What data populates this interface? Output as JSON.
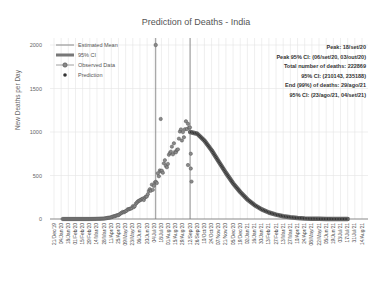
{
  "chart_data": {
    "type": "line",
    "title": "Prediction of Deaths - India",
    "xlabel": "",
    "ylabel": "New Deaths per Day",
    "ylim": [
      0,
      2000
    ],
    "yticks": [
      0,
      500,
      1000,
      1500,
      2000
    ],
    "grid": true,
    "legend_position": "upper left",
    "legend": [
      "Estimated Mean",
      "95% CI",
      "Observed Data",
      "Prediction"
    ],
    "annotations": [
      "Peak: 18/set/20",
      "Peak 95% CI: (06/set/20, 03/out/20)",
      "Total number of deaths: 222869",
      "95% CI: (210143, 235188)",
      "End (99%) of deaths: 29/ago/21",
      "95% CI: (23/ago/21, 04/set/21)"
    ],
    "x_tick_labels": [
      "21/Dec/19",
      "04/Jan/20",
      "18/Jan/20",
      "01/Feb/20",
      "15/Feb/20",
      "29/Feb/20",
      "14/Mar/20",
      "28/Mar/20",
      "11/Apr/20",
      "25/Apr/20",
      "09/May/20",
      "23/May/20",
      "06/Jun/20",
      "20/Jun/20",
      "04/Jul/20",
      "18/Jul/20",
      "01/Aug/20",
      "15/Aug/20",
      "29/Aug/20",
      "12/Sep/20",
      "26/Sep/20",
      "10/Oct/20",
      "24/Oct/20",
      "07/Nov/20",
      "21/Nov/20",
      "05/Dec/20",
      "19/Dec/20",
      "02/Jan/21",
      "16/Jan/21",
      "30/Jan/21",
      "13/Feb/21",
      "27/Feb/21",
      "13/Mar/21",
      "27/Mar/21",
      "10/Apr/21",
      "24/Apr/21",
      "08/May/21",
      "22/May/21",
      "05/Jun/21",
      "19/Jun/21",
      "03/Jul/21",
      "17/Jul/21",
      "31/Jul/21",
      "14/Aug/21"
    ],
    "series": [
      {
        "name": "Observed Data",
        "x_index": [
          3,
          4,
          5,
          6,
          7,
          8,
          9,
          10,
          11,
          12,
          13,
          14,
          15,
          16,
          17,
          18,
          18.5,
          19
        ],
        "values": [
          0,
          0,
          0,
          2,
          5,
          20,
          50,
          90,
          140,
          200,
          280,
          400,
          550,
          700,
          850,
          1000,
          1150,
          1100
        ],
        "outlier": {
          "x_index": 14.2,
          "value": 2000
        }
      },
      {
        "name": "Estimated Mean",
        "x_index": [
          19,
          20,
          21,
          22,
          23,
          24,
          25,
          26,
          27,
          28,
          29,
          30,
          31,
          32,
          33,
          34,
          35,
          36,
          37,
          38,
          39,
          40,
          41
        ],
        "values": [
          1000,
          980,
          900,
          790,
          660,
          530,
          410,
          310,
          225,
          160,
          110,
          75,
          50,
          32,
          20,
          12,
          7,
          4,
          2,
          1,
          0,
          0,
          0
        ]
      },
      {
        "name": "Prediction",
        "x_index": [
          19,
          20,
          21,
          22,
          23,
          24,
          25,
          26,
          27,
          28,
          29,
          30,
          31,
          32,
          33,
          34,
          35,
          36,
          37,
          38,
          39,
          40,
          41
        ],
        "values": [
          1000,
          980,
          900,
          790,
          660,
          530,
          410,
          310,
          225,
          160,
          110,
          75,
          50,
          32,
          20,
          12,
          7,
          4,
          2,
          1,
          0,
          0,
          0
        ]
      }
    ],
    "vertical_lines": [
      {
        "x_index": 14.2,
        "label": "outlier"
      },
      {
        "x_index": 19,
        "label": "last observation"
      }
    ]
  },
  "legend_labels": {
    "mean": "Estimated Mean",
    "ci": "95% CI",
    "observed": "Observed Data",
    "prediction": "Prediction"
  }
}
